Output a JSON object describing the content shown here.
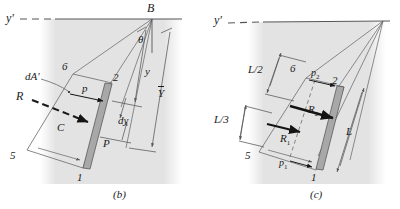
{
  "figure": {
    "title_semantic": "hydrostatic-pressure-on-inclined-plate",
    "background_color": "#ffffff",
    "shade_color": "#e3e3e3",
    "plate_color": "#a8a8a8",
    "line_color": "#55555a",
    "ink_color": "#1a1a1a"
  },
  "panel_b": {
    "caption": "(b)",
    "axis_label": "y'",
    "point_b": "B",
    "angle_label": "θ",
    "corner_1": "1",
    "corner_2": "2",
    "corner_5": "5",
    "corner_6": "6",
    "area_element": "dA'",
    "resultant": "R",
    "centroid": "C",
    "pressure": "P",
    "pressure_arm": "p",
    "strip_height": "dy",
    "depth_y": "y",
    "depth_ybar": "Y"
  },
  "panel_c": {
    "caption": "(c)",
    "axis_label": "y'",
    "corner_1": "1",
    "corner_2": "2",
    "corner_5": "5",
    "corner_6": "6",
    "pressure_top": "p2",
    "pressure_bottom": "p1",
    "force_1": "R1",
    "force_2": "R2",
    "dim_half": "L/2",
    "dim_third": "L/3",
    "dim_length": "L"
  }
}
